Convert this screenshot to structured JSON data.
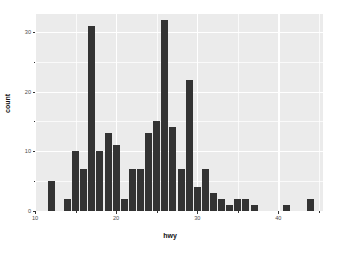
{
  "chart_data": {
    "type": "bar",
    "title": "",
    "subtitle": "",
    "xlabel": "hwy",
    "ylabel": "count",
    "xlim": [
      10.0,
      45.5
    ],
    "ylim": [
      0,
      33
    ],
    "binwidth": 1,
    "grid": true,
    "legend": "none",
    "x_ticks": [
      10,
      20,
      30,
      40
    ],
    "x_tick_labels": [
      "10",
      "20",
      "30",
      "40"
    ],
    "x_minor_ticks": [
      15,
      25,
      35,
      45
    ],
    "y_ticks": [
      0,
      10,
      20,
      30
    ],
    "y_tick_labels": [
      "0",
      "10",
      "20",
      "30"
    ],
    "y_minor_ticks": [
      5,
      15,
      25
    ],
    "bar_color": "#333333",
    "panel_color": "#EBEBEB",
    "grid_color": "#FFFFFF",
    "categories": [
      12,
      14,
      15,
      16,
      17,
      18,
      19,
      20,
      21,
      22,
      23,
      24,
      25,
      26,
      27,
      28,
      29,
      30,
      31,
      32,
      33,
      34,
      35,
      36,
      37,
      41,
      44
    ],
    "values": [
      5,
      2,
      10,
      7,
      31,
      10,
      13,
      11,
      2,
      7,
      7,
      13,
      15,
      32,
      14,
      7,
      22,
      4,
      7,
      3,
      2,
      1,
      2,
      2,
      1,
      1,
      2
    ]
  },
  "axis": {
    "x_title": "hwy",
    "y_title": "count"
  }
}
